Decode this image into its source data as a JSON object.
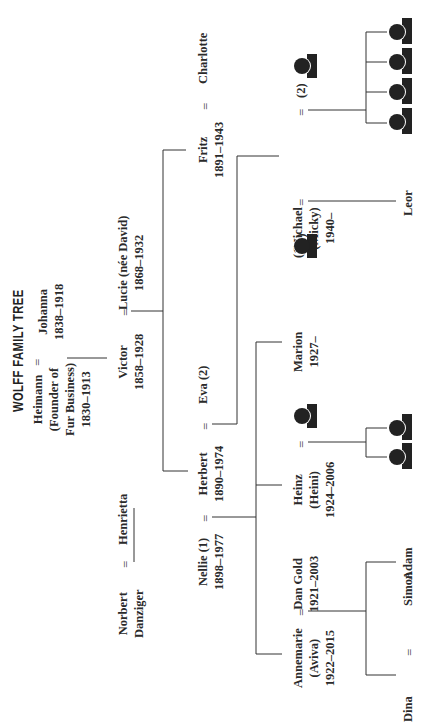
{
  "title": "WOLFF FAMILY TREE",
  "equals": "=",
  "generations": {
    "gen1": {
      "husband": {
        "name": "Heimann\n(Founder of\nFur Business)\n1830–1913"
      },
      "wife": {
        "name": "Johanna\n1838–1918"
      }
    },
    "gen2": {
      "husband": {
        "name": "Victor\n1858–1928"
      },
      "wife": {
        "name": "Lucie (née David)\n1868–1932"
      },
      "in_laws": {
        "husband": "Norbert\nDanziger",
        "wife": "Henrietta"
      }
    },
    "gen3": {
      "herbert": "Herbert\n1890–1974",
      "nellie": "Nellie (1)\n1898–1977",
      "eva": "Eva (2)",
      "fritz": "Fritz\n1891–1943",
      "charlotte": "Charlotte"
    },
    "gen4": {
      "annemarie": "Annemarie\n(Aviva)\n1922–2015",
      "dan": "Dan Gold\n1921–2003",
      "heinz": "Heinz\n(Heini)\n1924–2006",
      "marion": "Marion\n1927–",
      "michael": "Michael\n(Micky)\n1940–",
      "spouse1_label": "(1)",
      "spouse2_label": "(2)"
    },
    "gen5": {
      "dina": "Dina",
      "simon": "Simon",
      "adam": "Adam",
      "leor": "Leor"
    }
  },
  "icons": {
    "person": "person-silhouette-icon",
    "count_heinz_children": 2,
    "count_michael_children": 4
  }
}
